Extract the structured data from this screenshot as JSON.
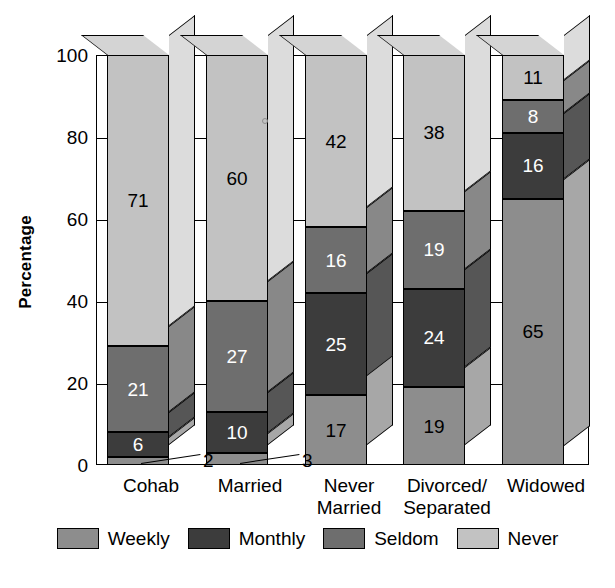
{
  "chart_data": {
    "type": "bar",
    "subtype": "stacked-3d-column",
    "title": "",
    "xlabel": "",
    "ylabel": "Percentage",
    "ylim": [
      0,
      100
    ],
    "yticks": [
      0,
      20,
      40,
      60,
      80,
      100
    ],
    "grid": false,
    "legend_position": "bottom",
    "stack_order_bottom_to_top": [
      "Weekly",
      "Monthly",
      "Seldom",
      "Never"
    ],
    "categories": [
      "Cohab",
      "Married",
      "Never Married",
      "Divorced/Separated",
      "Widowed"
    ],
    "category_label_lines": [
      [
        "Cohab"
      ],
      [
        "Married"
      ],
      [
        "Never",
        "Married"
      ],
      [
        "Divorced/",
        "Separated"
      ],
      [
        "Widowed"
      ]
    ],
    "series": [
      {
        "name": "Weekly",
        "color": "#8d8d8d",
        "values": [
          2,
          3,
          17,
          19,
          65
        ]
      },
      {
        "name": "Monthly",
        "color": "#3c3c3c",
        "values": [
          6,
          10,
          25,
          24,
          16
        ]
      },
      {
        "name": "Seldom",
        "color": "#6e6e6e",
        "values": [
          21,
          27,
          16,
          19,
          8
        ]
      },
      {
        "name": "Never",
        "color": "#c2c2c2",
        "values": [
          71,
          60,
          42,
          38,
          11
        ]
      }
    ],
    "value_label_color_overrides": {
      "note": "light text on dark segments, dark text on light segments"
    }
  },
  "legend": {
    "items": [
      {
        "label": "Weekly",
        "color": "#8d8d8d"
      },
      {
        "label": "Monthly",
        "color": "#3c3c3c"
      },
      {
        "label": "Seldom",
        "color": "#6e6e6e"
      },
      {
        "label": "Never",
        "color": "#c2c2c2"
      }
    ]
  },
  "axis": {
    "y_title": "Percentage",
    "y_tick_labels": [
      "100",
      "80",
      "60",
      "40",
      "20",
      "0"
    ]
  },
  "colors": {
    "weekly": "#8d8d8d",
    "monthly": "#3c3c3c",
    "seldom": "#6e6e6e",
    "never": "#c2c2c2",
    "outline": "#000000",
    "background": "#ffffff"
  }
}
